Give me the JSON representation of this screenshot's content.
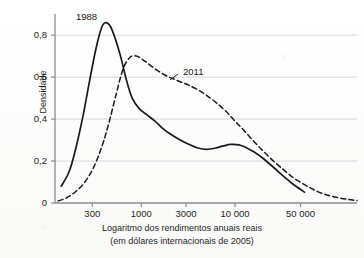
{
  "chart_data": {
    "type": "line",
    "title": "",
    "subtitle": "",
    "xlabel_line1": "Logaritmo dos rendimentos anuais reais",
    "xlabel_line2": "(em dólares internacionais de 2005)",
    "ylabel": "Densidade",
    "x_scale": "log",
    "x_tick_labels": [
      "300",
      "1000",
      "3000",
      "10 000",
      "50 000"
    ],
    "x_tick_values": [
      300,
      1000,
      3000,
      10000,
      50000
    ],
    "y_tick_labels": [
      "0",
      "0,2",
      "0,4",
      "0,6",
      "0,8"
    ],
    "y_tick_values": [
      0,
      0.2,
      0.4,
      0.6,
      0.8
    ],
    "ylim": [
      0,
      0.92
    ],
    "xlim": [
      120,
      200000
    ],
    "grid": true,
    "grid_axis": "y",
    "legend_position": "inline-annotations",
    "colors": {
      "curve": "#1a1a1a",
      "grid": "#d8d8d8",
      "axis": "#8c8c8c",
      "text": "#1e1e1e",
      "background": "#fdfdfc"
    },
    "series": [
      {
        "name": "1988",
        "style": "solid",
        "annotation": "1988",
        "x": [
          140,
          170,
          200,
          240,
          280,
          330,
          380,
          420,
          470,
          530,
          600,
          700,
          800,
          950,
          1150,
          1400,
          1700,
          2100,
          2600,
          3200,
          4000,
          5000,
          6200,
          7500,
          9000,
          11000,
          13000,
          16000,
          20000,
          26000,
          33000,
          42000,
          55000
        ],
        "y": [
          0.08,
          0.15,
          0.26,
          0.42,
          0.58,
          0.74,
          0.84,
          0.86,
          0.84,
          0.78,
          0.7,
          0.58,
          0.5,
          0.45,
          0.42,
          0.39,
          0.355,
          0.325,
          0.3,
          0.28,
          0.262,
          0.256,
          0.262,
          0.272,
          0.279,
          0.277,
          0.265,
          0.243,
          0.212,
          0.168,
          0.127,
          0.088,
          0.052
        ]
      },
      {
        "name": "2011",
        "style": "dashed",
        "annotation": "2011",
        "x": [
          130,
          160,
          200,
          250,
          310,
          380,
          450,
          540,
          640,
          760,
          900,
          1100,
          1350,
          1700,
          2100,
          2600,
          3200,
          4000,
          5000,
          6300,
          8000,
          10000,
          12500,
          16000,
          20000,
          26000,
          33000,
          42000,
          55000,
          70000,
          90000,
          120000,
          160000,
          200000
        ],
        "y": [
          0.01,
          0.025,
          0.055,
          0.1,
          0.17,
          0.27,
          0.38,
          0.52,
          0.64,
          0.695,
          0.7,
          0.675,
          0.645,
          0.615,
          0.595,
          0.578,
          0.562,
          0.54,
          0.512,
          0.478,
          0.437,
          0.39,
          0.345,
          0.292,
          0.247,
          0.198,
          0.158,
          0.12,
          0.088,
          0.062,
          0.042,
          0.027,
          0.017,
          0.012
        ]
      }
    ]
  },
  "annotations": {
    "series_1988": "1988",
    "series_2011": "2011"
  }
}
